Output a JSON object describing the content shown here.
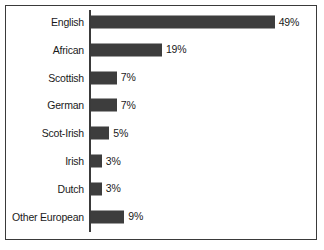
{
  "chart_data": {
    "type": "bar",
    "orientation": "horizontal",
    "title": "",
    "subtitle": "",
    "xlabel": "",
    "ylabel": "",
    "grid": false,
    "legend": false,
    "xlim": [
      0,
      50
    ],
    "value_suffix": "%",
    "categories": [
      "English",
      "African",
      "Scottish",
      "German",
      "Scot-Irish",
      "Irish",
      "Dutch",
      "Other European"
    ],
    "values": [
      49,
      19,
      7,
      7,
      5,
      3,
      3,
      9
    ],
    "value_labels": [
      "49%",
      "19%",
      "7%",
      "7%",
      "5%",
      "3%",
      "3%",
      "9%"
    ],
    "bars": [
      {
        "category": "English",
        "value": 49,
        "label": "49%"
      },
      {
        "category": "African",
        "value": 19,
        "label": "19%"
      },
      {
        "category": "Scottish",
        "value": 7,
        "label": "7%"
      },
      {
        "category": "German",
        "value": 7,
        "label": "7%"
      },
      {
        "category": "Scot-Irish",
        "value": 5,
        "label": "5%"
      },
      {
        "category": "Irish",
        "value": 3,
        "label": "3%"
      },
      {
        "category": "Dutch",
        "value": 3,
        "label": "3%"
      },
      {
        "category": "Other European",
        "value": 9,
        "label": "9%"
      }
    ]
  },
  "style": {
    "bar_color": "#3d3d3d",
    "axis_color": "#3a3a3a",
    "border_color": "#3a3a3a",
    "text_color": "#1a1a1a",
    "background": "#ffffff"
  }
}
